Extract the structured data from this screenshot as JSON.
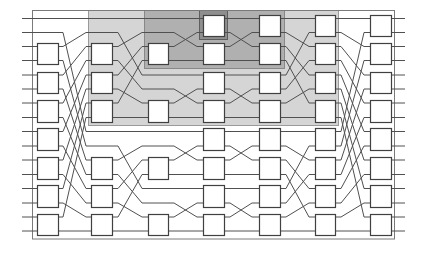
{
  "diagram": {
    "type": "switching-network",
    "num_lines": 16,
    "line_y": [
      18.5,
      32.5,
      46.5,
      60.5,
      75,
      89,
      103,
      117.5,
      131.5,
      146,
      160,
      174.5,
      188.5,
      203,
      217,
      231
    ],
    "input_x": 22,
    "output_x": 405,
    "box_pad": 3.5,
    "frame": {
      "x": 32.5,
      "y": 10.5,
      "w": 362,
      "h": 228.5
    },
    "colors": {
      "wire": "#505050",
      "box_stroke": "#404040",
      "box_fill": "#ffffff",
      "frame": "#7a7a7a"
    },
    "regions": [
      {
        "name": "shaded-region-upper-subnetwork",
        "x": 88,
        "y": 10,
        "w": 250,
        "h": 115,
        "fill": "#d5d5d5",
        "stroke": "#9a9a9a"
      },
      {
        "name": "shaded-region-upper-quarter-subnetwork",
        "x": 144,
        "y": 10,
        "w": 140,
        "h": 58,
        "fill": "#b0b0b0",
        "stroke": "#888888"
      },
      {
        "name": "shaded-region-center-switch",
        "x": 199,
        "y": 10,
        "w": 28,
        "h": 29,
        "fill": "#8f8f8f",
        "stroke": "#5e5e5e"
      }
    ],
    "columns": [
      {
        "name": "stage-1",
        "x": 37,
        "w": 21,
        "boxes": [
          1,
          2,
          3,
          4,
          5,
          6,
          7
        ]
      },
      {
        "name": "stage-2",
        "x": 91,
        "w": 21,
        "boxes": [
          1,
          2,
          3,
          5,
          6,
          7
        ]
      },
      {
        "name": "stage-3",
        "x": 148,
        "w": 20,
        "boxes": [
          1,
          3,
          5,
          7
        ]
      },
      {
        "name": "stage-4",
        "x": 203,
        "w": 21,
        "boxes": [
          0,
          1,
          2,
          3,
          4,
          5,
          6,
          7
        ]
      },
      {
        "name": "stage-5",
        "x": 259,
        "w": 21,
        "boxes": [
          0,
          1,
          2,
          3,
          4,
          5,
          6,
          7
        ]
      },
      {
        "name": "stage-6",
        "x": 315,
        "w": 20,
        "boxes": [
          0,
          1,
          2,
          3,
          4,
          5,
          6,
          7
        ]
      },
      {
        "name": "stage-7",
        "x": 370,
        "w": 21,
        "boxes": [
          0,
          1,
          2,
          3,
          4,
          5,
          6,
          7
        ]
      }
    ],
    "stages": [
      {
        "diag": [
          63,
          86
        ],
        "perm": [
          0,
          8,
          1,
          9,
          2,
          10,
          3,
          11,
          4,
          12,
          5,
          13,
          6,
          14,
          7,
          15
        ]
      },
      {
        "diag": [
          118,
          142
        ],
        "perm": [
          0,
          4,
          1,
          5,
          2,
          6,
          3,
          7,
          8,
          12,
          9,
          13,
          10,
          14,
          11,
          15
        ]
      },
      {
        "diag": [
          174,
          197
        ],
        "perm": [
          0,
          2,
          1,
          3,
          4,
          6,
          5,
          7,
          8,
          10,
          9,
          11,
          12,
          14,
          13,
          15
        ]
      },
      {
        "diag": [
          230,
          252
        ],
        "perm": [
          0,
          2,
          1,
          3,
          4,
          6,
          5,
          7,
          8,
          10,
          9,
          11,
          12,
          14,
          13,
          15
        ]
      },
      {
        "diag": [
          286,
          309
        ],
        "perm": [
          0,
          2,
          4,
          6,
          1,
          3,
          5,
          7,
          8,
          10,
          12,
          14,
          9,
          11,
          13,
          15
        ]
      },
      {
        "diag": [
          341,
          364
        ],
        "perm": [
          0,
          2,
          4,
          6,
          8,
          10,
          12,
          14,
          1,
          3,
          5,
          7,
          9,
          11,
          13,
          15
        ]
      }
    ]
  }
}
